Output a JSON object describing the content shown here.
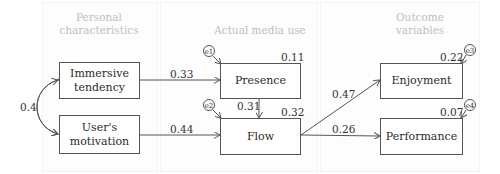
{
  "columns": [
    {
      "id": "personal",
      "title_line1": "Personal",
      "title_line2": "characteristics"
    },
    {
      "id": "media",
      "title_line1": "Actual media use",
      "title_line2": ""
    },
    {
      "id": "outcome",
      "title_line1": "Outcome",
      "title_line2": "variables"
    }
  ],
  "nodes": {
    "immersive": {
      "line1": "Immersive",
      "line2": "tendency"
    },
    "motivation": {
      "line1": "User's",
      "line2": "motivation"
    },
    "presence": {
      "label": "Presence",
      "r2": "0.11",
      "error": "e1"
    },
    "flow": {
      "label": "Flow",
      "r2": "0.32",
      "error": "e2"
    },
    "enjoyment": {
      "label": "Enjoyment",
      "r2": "0.22",
      "error": "e3"
    },
    "performance": {
      "label": "Performance",
      "r2": "0.07",
      "error": "e4"
    }
  },
  "paths": [
    {
      "from": "immersive",
      "to": "presence",
      "coef": "0.33"
    },
    {
      "from": "motivation",
      "to": "flow",
      "coef": "0.44"
    },
    {
      "from": "presence",
      "to": "flow",
      "coef": "0.31"
    },
    {
      "from": "flow",
      "to": "enjoyment",
      "coef": "0.47"
    },
    {
      "from": "flow",
      "to": "performance",
      "coef": "0.26"
    }
  ],
  "correlation": {
    "between": [
      "immersive",
      "motivation"
    ],
    "coef": "0.4"
  },
  "colors": {
    "line": "#555555",
    "column_title": "#bdbdbd",
    "text": "#2a2a2a"
  }
}
